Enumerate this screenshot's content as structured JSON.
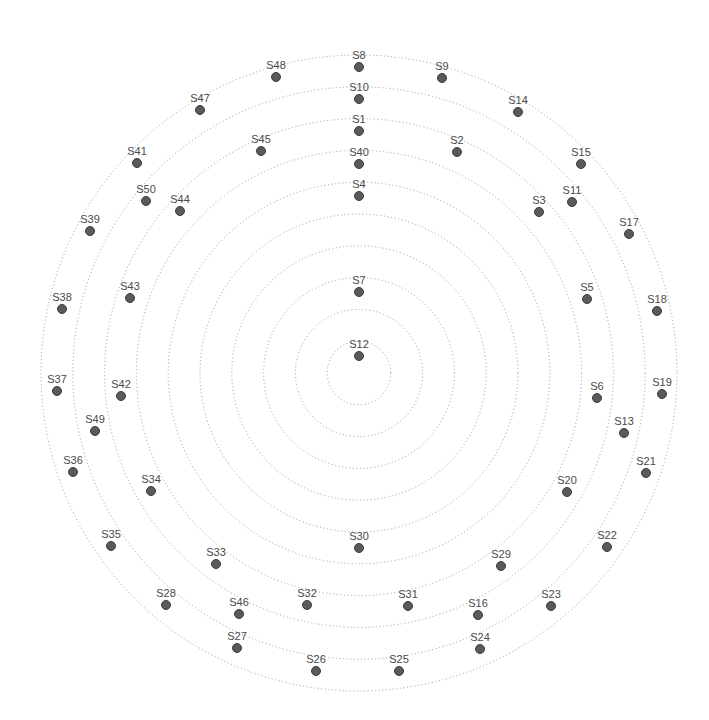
{
  "diagram": {
    "type": "concentric-rings",
    "center": {
      "x": 359,
      "y": 373
    },
    "ring_spacing": 31.8,
    "ring_count": 10,
    "colors": {
      "ring": "#9a9a9a",
      "node": "#5a5a5a",
      "label": "#4a4a4a",
      "background": "#ffffff"
    },
    "nodes": [
      {
        "id": "S1",
        "x": 359,
        "y": 131
      },
      {
        "id": "S2",
        "x": 457,
        "y": 152
      },
      {
        "id": "S3",
        "x": 539,
        "y": 212
      },
      {
        "id": "S4",
        "x": 359,
        "y": 196
      },
      {
        "id": "S5",
        "x": 587,
        "y": 299
      },
      {
        "id": "S6",
        "x": 597,
        "y": 398
      },
      {
        "id": "S7",
        "x": 359,
        "y": 292
      },
      {
        "id": "S8",
        "x": 359,
        "y": 67
      },
      {
        "id": "S9",
        "x": 442,
        "y": 78
      },
      {
        "id": "S10",
        "x": 359,
        "y": 99
      },
      {
        "id": "S11",
        "x": 572,
        "y": 202
      },
      {
        "id": "S12",
        "x": 359,
        "y": 356
      },
      {
        "id": "S13",
        "x": 624,
        "y": 433
      },
      {
        "id": "S14",
        "x": 518,
        "y": 112
      },
      {
        "id": "S15",
        "x": 581,
        "y": 164
      },
      {
        "id": "S16",
        "x": 478,
        "y": 615
      },
      {
        "id": "S17",
        "x": 629,
        "y": 234
      },
      {
        "id": "S18",
        "x": 657,
        "y": 311
      },
      {
        "id": "S19",
        "x": 662,
        "y": 394
      },
      {
        "id": "S20",
        "x": 567,
        "y": 492
      },
      {
        "id": "S21",
        "x": 646,
        "y": 473
      },
      {
        "id": "S22",
        "x": 607,
        "y": 547
      },
      {
        "id": "S23",
        "x": 551,
        "y": 606
      },
      {
        "id": "S24",
        "x": 480,
        "y": 649
      },
      {
        "id": "S25",
        "x": 399,
        "y": 671
      },
      {
        "id": "S26",
        "x": 316,
        "y": 671
      },
      {
        "id": "S27",
        "x": 237,
        "y": 648
      },
      {
        "id": "S28",
        "x": 166,
        "y": 605
      },
      {
        "id": "S29",
        "x": 501,
        "y": 566
      },
      {
        "id": "S30",
        "x": 359,
        "y": 548
      },
      {
        "id": "S31",
        "x": 408,
        "y": 606
      },
      {
        "id": "S32",
        "x": 307,
        "y": 605
      },
      {
        "id": "S33",
        "x": 216,
        "y": 564
      },
      {
        "id": "S34",
        "x": 151,
        "y": 491
      },
      {
        "id": "S35",
        "x": 111,
        "y": 546
      },
      {
        "id": "S36",
        "x": 73,
        "y": 472
      },
      {
        "id": "S37",
        "x": 57,
        "y": 391
      },
      {
        "id": "S38",
        "x": 62,
        "y": 309
      },
      {
        "id": "S39",
        "x": 90,
        "y": 231
      },
      {
        "id": "S40",
        "x": 359,
        "y": 164
      },
      {
        "id": "S41",
        "x": 137,
        "y": 163
      },
      {
        "id": "S42",
        "x": 121,
        "y": 396
      },
      {
        "id": "S43",
        "x": 130,
        "y": 298
      },
      {
        "id": "S44",
        "x": 180,
        "y": 211
      },
      {
        "id": "S45",
        "x": 261,
        "y": 151
      },
      {
        "id": "S46",
        "x": 239,
        "y": 614
      },
      {
        "id": "S47",
        "x": 200,
        "y": 110
      },
      {
        "id": "S48",
        "x": 276,
        "y": 77
      },
      {
        "id": "S49",
        "x": 95,
        "y": 431
      },
      {
        "id": "S50",
        "x": 146,
        "y": 201
      }
    ]
  }
}
